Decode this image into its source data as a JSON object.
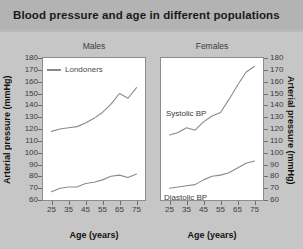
{
  "title": "Blood pressure and age in different populations",
  "axes": {
    "y_label": "Arterial pressure (mmHg)",
    "x_label": "Age (years)",
    "y_ticks": [
      180,
      170,
      160,
      150,
      140,
      130,
      120,
      110,
      100,
      90,
      80,
      70,
      60
    ],
    "x_ticks": [
      25,
      35,
      45,
      55,
      65,
      75
    ]
  },
  "panels": {
    "males": {
      "title": "Males"
    },
    "females": {
      "title": "Females"
    }
  },
  "legend": {
    "males_series": "Londoners"
  },
  "series_labels": {
    "systolic": "Systolic BP",
    "diastolic": "Diastolic BP"
  },
  "colors": {
    "page_background": "#c6c6c6",
    "title_background": "#b3b3b3",
    "panel_background": "#ffffff",
    "line": "#8a8a8a",
    "axis": "#6e6e6e",
    "text": "#3c3c3c"
  },
  "chart_data": {
    "type": "line",
    "title": "Blood pressure and age in different populations",
    "xlabel": "Age (years)",
    "ylabel": "Arterial pressure (mmHg)",
    "xlim": [
      20,
      80
    ],
    "ylim": [
      60,
      180
    ],
    "grid": false,
    "legend": "inside top-left of Males panel",
    "x": [
      25,
      30,
      35,
      40,
      45,
      50,
      55,
      60,
      65,
      70,
      75
    ],
    "panels": [
      {
        "name": "Males",
        "series": [
          {
            "name": "Systolic BP",
            "legend_entry": "Londoners",
            "values": [
              118,
              120,
              121,
              122,
              125,
              129,
              134,
              141,
              150,
              146,
              155
            ]
          },
          {
            "name": "Diastolic BP",
            "legend_entry": "Londoners",
            "values": [
              67,
              70,
              71,
              71,
              74,
              75,
              77,
              80,
              81,
              79,
              82
            ]
          }
        ]
      },
      {
        "name": "Females",
        "series": [
          {
            "name": "Systolic BP",
            "values": [
              115,
              117,
              121,
              119,
              126,
              131,
              134,
              145,
              157,
              168,
              173
            ]
          },
          {
            "name": "Diastolic BP",
            "values": [
              70,
              71,
              72,
              73,
              77,
              80,
              81,
              83,
              87,
              91,
              93
            ]
          }
        ]
      }
    ]
  }
}
